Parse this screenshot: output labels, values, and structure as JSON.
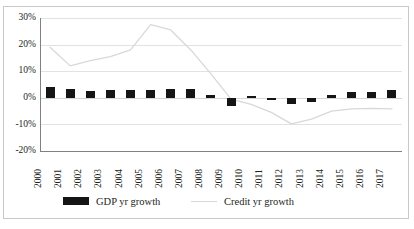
{
  "chart_data": {
    "type": "bar",
    "title": "",
    "xlabel": "",
    "ylabel": "",
    "ylim": [
      -20,
      30
    ],
    "yticks": [
      "30%",
      "20%",
      "10%",
      "0%",
      "-10%",
      "-20%"
    ],
    "ytick_values": [
      30,
      20,
      10,
      0,
      -10,
      -20
    ],
    "grid": true,
    "legend_position": "bottom",
    "categories": [
      "2000",
      "2001",
      "2002",
      "2003",
      "2004",
      "2005",
      "2006",
      "2007",
      "2008",
      "2009",
      "2010",
      "2011",
      "2012",
      "2013",
      "2014",
      "2015",
      "2016",
      "2017"
    ],
    "series": [
      {
        "name": "GDP yr growth",
        "type": "bar",
        "color": "#151515",
        "values": [
          4.2,
          3.4,
          2.6,
          2.8,
          2.8,
          3.0,
          3.4,
          3.2,
          1.0,
          -3.2,
          0.0,
          -0.8,
          -2.2,
          -1.4,
          1.2,
          2.2,
          2.2,
          2.8
        ]
      },
      {
        "name": "Credit yr growth",
        "type": "line",
        "color": "#d8d8d8",
        "values": [
          19.0,
          12.0,
          14.0,
          15.5,
          18.0,
          27.5,
          25.5,
          18.0,
          9.0,
          -0.5,
          -2.5,
          -5.5,
          -9.8,
          -8.0,
          -5.0,
          -4.2,
          -4.0,
          -4.2
        ]
      }
    ]
  },
  "legend": {
    "items": [
      {
        "label": "GDP yr growth",
        "marker": "bar-swatch-icon"
      },
      {
        "label": "Credit yr growth",
        "marker": "line-swatch-icon"
      }
    ]
  }
}
